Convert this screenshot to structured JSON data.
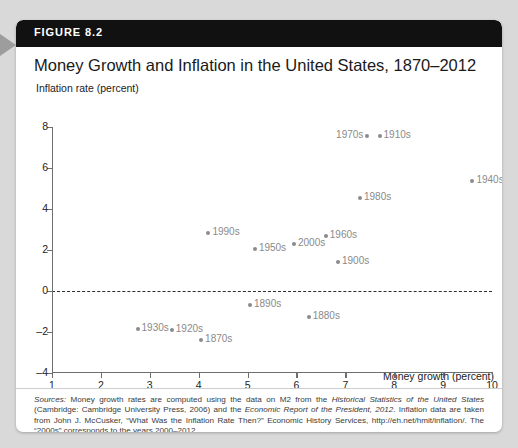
{
  "figure": {
    "number_label": "FIGURE 8.2",
    "title": "Money Growth and Inflation in the United States, 1870–2012"
  },
  "colors": {
    "header_bg": "#111111",
    "card_bg": "#ffffff",
    "page_bg": "#d9d9d9",
    "point": "#8b8b8b",
    "label_text": "#8a8a8a",
    "axis": "#6e6e6e"
  },
  "chart_data": {
    "type": "scatter",
    "title": "Money Growth and Inflation in the United States, 1870–2012",
    "xlabel": "Money growth (percent)",
    "ylabel": "Inflation rate (percent)",
    "xlim": [
      1,
      10
    ],
    "ylim": [
      -4,
      8
    ],
    "xticks": [
      1,
      2,
      3,
      4,
      5,
      6,
      7,
      8,
      9,
      10
    ],
    "yticks": [
      8,
      6,
      4,
      2,
      0,
      -2,
      -4
    ],
    "grid": false,
    "legend": null,
    "annotations": [
      {
        "text": "zero inflation reference line",
        "type": "dashed-hline",
        "y": 0
      }
    ],
    "points": [
      {
        "label": "1970s",
        "x": 7.45,
        "y": 7.55,
        "label_side": "left"
      },
      {
        "label": "1910s",
        "x": 7.7,
        "y": 7.55,
        "label_side": "right"
      },
      {
        "label": "1940s",
        "x": 9.6,
        "y": 5.35,
        "label_side": "right"
      },
      {
        "label": "1980s",
        "x": 7.3,
        "y": 4.55,
        "label_side": "right"
      },
      {
        "label": "1990s",
        "x": 4.2,
        "y": 2.85,
        "label_side": "right"
      },
      {
        "label": "1960s",
        "x": 6.6,
        "y": 2.7,
        "label_side": "right"
      },
      {
        "label": "2000s",
        "x": 5.95,
        "y": 2.3,
        "label_side": "right"
      },
      {
        "label": "1950s",
        "x": 5.15,
        "y": 2.05,
        "label_side": "right"
      },
      {
        "label": "1900s",
        "x": 6.85,
        "y": 1.4,
        "label_side": "right"
      },
      {
        "label": "1890s",
        "x": 5.05,
        "y": -0.7,
        "label_side": "right"
      },
      {
        "label": "1880s",
        "x": 6.25,
        "y": -1.25,
        "label_side": "right"
      },
      {
        "label": "1930s",
        "x": 2.75,
        "y": -1.85,
        "label_side": "right"
      },
      {
        "label": "1920s",
        "x": 3.45,
        "y": -1.9,
        "label_side": "right"
      },
      {
        "label": "1870s",
        "x": 4.05,
        "y": -2.4,
        "label_side": "right"
      }
    ]
  },
  "source_note": {
    "prefix": "Sources:",
    "body_1": " Money growth rates are computed using the data on M2 from the ",
    "ital_1": "Historical Statistics of the United States",
    "body_2": " (Cambridge: Cambridge University Press, 2006) and the ",
    "ital_2": "Economic Report of the President, 2012",
    "body_3": ". Inflation data are taken from John J. McCusker, “What Was the Inflation Rate Then?” Economic History Services, http://eh.net/hmit/inflation/. The “2000s” corresponds to the years 2000–2012."
  }
}
